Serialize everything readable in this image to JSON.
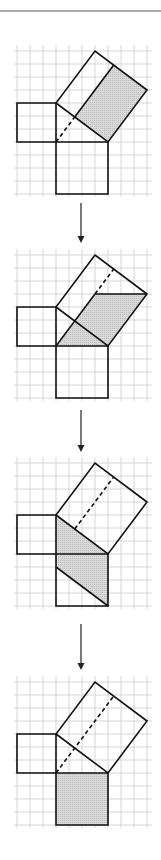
{
  "figure": {
    "unit_px": 13,
    "grid_color": "#cccccc",
    "stroke_color": "#111111",
    "shade_color": "#cfcfcf",
    "rule_color": "#555555",
    "arrow_color": "#222222",
    "triangle_units": {
      "a": 3,
      "b": 4,
      "c": 5
    },
    "panels": [
      {
        "id": "step-1",
        "top_y": 103,
        "shaded": "rectangle-in-hypotenuse-square",
        "altitude_style": "dashed-then-solid",
        "description": "Altitude from right angle splits hypotenuse square; right rectangle shaded"
      },
      {
        "id": "step-2",
        "top_y": 307,
        "shaded": "parallelogram-sheared-onto-leg",
        "altitude_style": "dashed-upper",
        "description": "Rectangle sheared into parallelogram with same base and height"
      },
      {
        "id": "step-3",
        "top_y": 515,
        "shaded": "parallelogram-rotated",
        "altitude_style": "dashed",
        "description": "Parallelogram rotated about vertex onto leg square side"
      },
      {
        "id": "step-4",
        "top_y": 734,
        "shaded": "square-on-long-leg",
        "altitude_style": "dashed-full",
        "description": "Sheared into square on leg of length 4; equal area"
      }
    ],
    "arrows": [
      {
        "x": 81,
        "y1": 203,
        "y2": 243
      },
      {
        "x": 81,
        "y1": 410,
        "y2": 452
      },
      {
        "x": 81,
        "y1": 624,
        "y2": 670
      }
    ],
    "top_rule_y": 11
  }
}
